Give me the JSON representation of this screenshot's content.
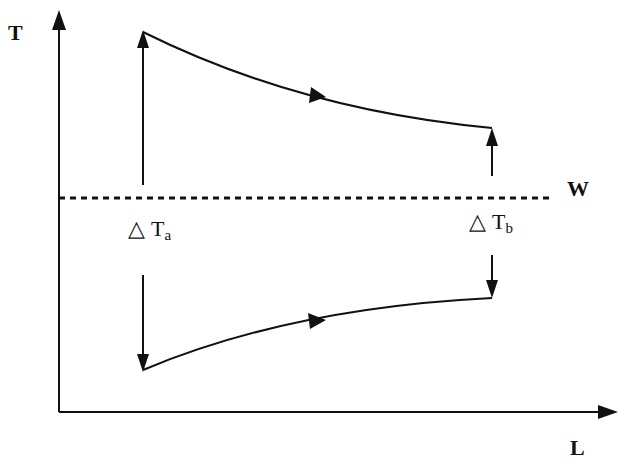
{
  "diagram": {
    "axes": {
      "y_label": "T",
      "x_label": "L"
    },
    "wall_label": "W",
    "delta_a": {
      "symbol": "△",
      "main": "T",
      "sub": "a"
    },
    "delta_b": {
      "symbol": "△",
      "main": "T",
      "sub": "b"
    },
    "curves": [
      {
        "name": "hot-fluid",
        "from": [
          143,
          32
        ],
        "to": [
          492,
          128
        ],
        "direction": "left-to-right"
      },
      {
        "name": "cold-fluid",
        "from": [
          143,
          370
        ],
        "to": [
          492,
          298
        ],
        "direction": "left-to-right"
      }
    ],
    "colors": {
      "ink": "#111111",
      "background": "#ffffff"
    }
  }
}
